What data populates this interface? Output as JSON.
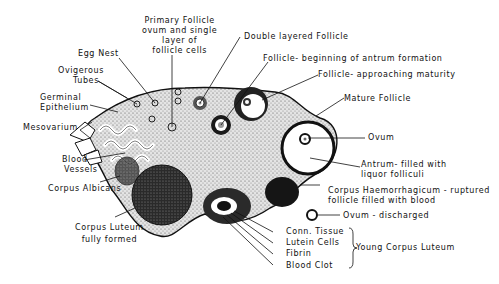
{
  "colors": {
    "ink": "#111111",
    "stroma": "#d8d8d8",
    "dark": "#1a1a1a",
    "paper": "#ffffff"
  },
  "labels": {
    "primary_follicle": [
      "Primary Follicle",
      "ovum and single",
      "layer of",
      "follicle cells"
    ],
    "egg_nest": "Egg Nest",
    "ovigerous_tubes": [
      "Ovigerous",
      "Tubes"
    ],
    "germinal_epithelium": [
      "Germinal",
      "Epithelium"
    ],
    "mesovarium": "Mesovarium",
    "blood_vessels": [
      "Blood",
      "Vessels"
    ],
    "corpus_albicans": "Corpus Albicans",
    "corpus_luteum_formed": [
      "Corpus Luteum",
      "fully formed"
    ],
    "double_layered_follicle": "Double layered Follicle",
    "follicle_antrum": "Follicle- beginning of antrum formation",
    "follicle_approaching": "Follicle- approaching maturity",
    "mature_follicle": "Mature Follicle",
    "ovum": "Ovum",
    "antrum": [
      "Antrum- filled with",
      "liquor folliculi"
    ],
    "corpus_haemorrhagicum": [
      "Corpus Haemorrhagicum - ruptured",
      "follicle filled with blood"
    ],
    "ovum_discharged": "Ovum - discharged",
    "conn_tissue": "Conn. Tissue",
    "lutein_cells": "Lutein Cells",
    "fibrin": "Fibrin",
    "blood_clot": "Blood Clot",
    "young_corpus_luteum": "Young Corpus Luteum"
  }
}
